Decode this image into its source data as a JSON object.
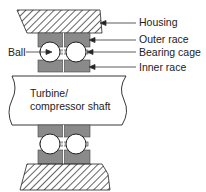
{
  "diagram": {
    "labels": {
      "housing": "Housing",
      "outer_race": "Outer race",
      "bearing_cage": "Bearing cage",
      "inner_race": "Inner race",
      "ball": "Ball",
      "shaft_line1": "Turbine/",
      "shaft_line2": "compressor shaft"
    },
    "colors": {
      "race_fill": "#8a8a8a",
      "line": "#222222",
      "background": "#ffffff"
    }
  }
}
